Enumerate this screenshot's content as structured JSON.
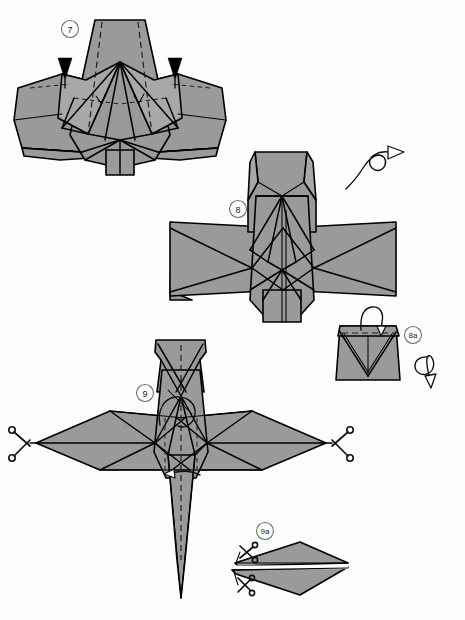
{
  "document": {
    "title": "Origami Diagram Sheet",
    "type": "origami-instruction-diagram",
    "page_width": 465,
    "page_height": 620,
    "background_color": "#ffffff",
    "paper_color": "#9a9a9a",
    "line_color": "#000000"
  },
  "steps": [
    {
      "id": "step-7",
      "label": "7",
      "badge_x": 70,
      "badge_y": 29,
      "symbols": [
        "sink-arrow-left",
        "sink-arrow-right",
        "valley-fold-creases"
      ],
      "description": "Wide winged base with sink arrows pointing down at both shoulders"
    },
    {
      "id": "step-8",
      "label": "8",
      "badge_x": 238,
      "badge_y": 209,
      "symbols": [
        "turn-over-arrow"
      ],
      "description": "Cross shaped model with long horizontal wings"
    },
    {
      "id": "step-8a",
      "label": "8a",
      "badge_x": 413,
      "badge_y": 335,
      "symbols": [
        "fold-over-arrow",
        "rotate-arrow"
      ],
      "description": "Detail close-up of the head showing folded tip"
    },
    {
      "id": "step-9",
      "label": "9",
      "badge_x": 145,
      "badge_y": 393,
      "symbols": [
        "scissors-left",
        "scissors-right",
        "fold-arrow-center"
      ],
      "description": "Swept-wing bird form with cut marks at both wing tips"
    },
    {
      "id": "step-9a",
      "label": "9a",
      "badge_x": 265,
      "badge_y": 531,
      "symbols": [
        "scissors-upper",
        "scissors-lower"
      ],
      "description": "Side profile detail with two cutting marks at the left point"
    }
  ],
  "legend": {
    "scissors_icon": "scissors-icon",
    "turn_over_icon": "turn-over-icon",
    "rotate_icon": "rotate-icon",
    "sink_icon": "sink-arrow-icon",
    "fold_icon": "fold-arrow-icon"
  }
}
